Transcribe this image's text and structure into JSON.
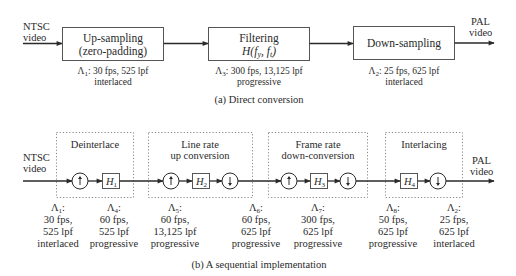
{
  "part_a": {
    "input_label": [
      "NTSC",
      "video"
    ],
    "output_label": [
      "PAL",
      "video"
    ],
    "blocks": [
      {
        "title": "Up-sampling",
        "subtitle": "(zero-padding)",
        "lattice": "Λ",
        "lattice_sub": "1",
        "spec_line1": ": 30 fps, 525 lpf",
        "spec_line2": "interlaced"
      },
      {
        "title": "Filtering",
        "subtitle_func": "H(f",
        "subtitle_sub1": "y",
        "subtitle_mid": ", f",
        "subtitle_sub2": "t",
        "subtitle_end": ")",
        "lattice": "Λ",
        "lattice_sub": "3",
        "spec_line1": ": 300 fps, 13,125 lpf",
        "spec_line2": "progressive"
      },
      {
        "title": "Down-sampling",
        "lattice": "Λ",
        "lattice_sub": "2",
        "spec_line1": ": 25 fps, 625 lpf",
        "spec_line2": "interlaced"
      }
    ],
    "caption": "(a) Direct conversion"
  },
  "part_b": {
    "input_label": [
      "NTSC",
      "video"
    ],
    "output_label": [
      "PAL",
      "video"
    ],
    "stages": [
      {
        "title": [
          "Deinterlace"
        ]
      },
      {
        "title": [
          "Line rate",
          "up conversion"
        ]
      },
      {
        "title": [
          "Frame rate",
          "down-conversion"
        ]
      },
      {
        "title": [
          "Interlacing"
        ]
      }
    ],
    "filters": [
      {
        "name": "H",
        "sub": "1"
      },
      {
        "name": "H",
        "sub": "2"
      },
      {
        "name": "H",
        "sub": "3"
      },
      {
        "name": "H",
        "sub": "4"
      }
    ],
    "operators": {
      "upsample_icon": "up-arrow-in-circle",
      "downsample_icon": "down-arrow-in-circle"
    },
    "lattices": [
      {
        "sym": "Λ",
        "sub": "1",
        "lines": [
          "30 fps,",
          "525 lpf",
          "interlaced"
        ]
      },
      {
        "sym": "Λ",
        "sub": "4",
        "lines": [
          "60 fps,",
          "525 lpf",
          "progressive"
        ]
      },
      {
        "sym": "Λ",
        "sub": "5",
        "lines": [
          "60 fps,",
          "13,125 lpf",
          "progressive"
        ]
      },
      {
        "sym": "Λ",
        "sub": "6",
        "lines": [
          "60 fps,",
          "625 lpf",
          "progressive"
        ]
      },
      {
        "sym": "Λ",
        "sub": "7",
        "lines": [
          "300 fps,",
          "625 lpf",
          "progressive"
        ]
      },
      {
        "sym": "Λ",
        "sub": "8",
        "lines": [
          "50 fps,",
          "625 lpf",
          "progressive"
        ]
      },
      {
        "sym": "Λ",
        "sub": "2",
        "lines": [
          "25 fps,",
          "625 lpf",
          "interlaced"
        ]
      }
    ],
    "caption": "(b) A sequential implementation"
  },
  "colors": {
    "ink": "#2a2a2a",
    "box_stroke": "#555555",
    "dotted_stroke": "#888888"
  }
}
